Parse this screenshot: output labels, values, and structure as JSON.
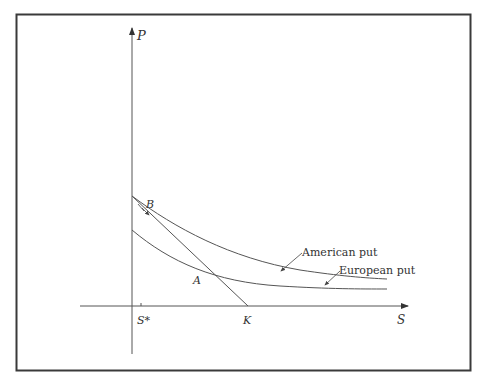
{
  "diagram": {
    "axes": {
      "y_label": "P",
      "x_label": "S",
      "x_ticks": [
        {
          "label": "S*",
          "x": 141
        },
        {
          "label": "K",
          "x": 248
        }
      ]
    },
    "curves": [
      {
        "name": "American put",
        "label": "American put"
      },
      {
        "name": "European put",
        "label": "European put"
      },
      {
        "name": "intrinsic value line",
        "label": ""
      }
    ],
    "points": [
      {
        "label": "A"
      },
      {
        "label": "B"
      }
    ],
    "colors": {
      "frame": "#3a3a3a",
      "lines": "#555555",
      "text": "#333333",
      "background": "#ffffff"
    }
  }
}
